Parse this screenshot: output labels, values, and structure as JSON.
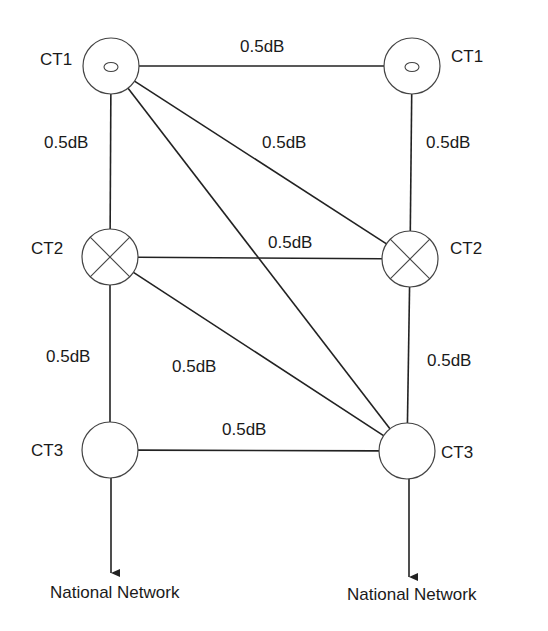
{
  "diagram": {
    "nodes": [
      {
        "id": "l_ct1",
        "label": "CT1",
        "symbol": "small-ellipse",
        "cx": 111,
        "cy": 66,
        "r": 28,
        "label_x": 40,
        "label_y": 65
      },
      {
        "id": "r_ct1",
        "label": "CT1",
        "symbol": "small-ellipse",
        "cx": 412,
        "cy": 66,
        "r": 28,
        "label_x": 451,
        "label_y": 62
      },
      {
        "id": "l_ct2",
        "label": "CT2",
        "symbol": "cross",
        "cx": 110,
        "cy": 257,
        "r": 28,
        "label_x": 31,
        "label_y": 254
      },
      {
        "id": "r_ct2",
        "label": "CT2",
        "symbol": "cross",
        "cx": 410,
        "cy": 259,
        "r": 28,
        "label_x": 450,
        "label_y": 254
      },
      {
        "id": "l_ct3",
        "label": "CT3",
        "symbol": "empty",
        "cx": 110,
        "cy": 450,
        "r": 28,
        "label_x": 31,
        "label_y": 456
      },
      {
        "id": "r_ct3",
        "label": "CT3",
        "symbol": "empty",
        "cx": 407,
        "cy": 451,
        "r": 28,
        "label_x": 441,
        "label_y": 458
      }
    ],
    "edges": [
      {
        "from": "l_ct1",
        "to": "r_ct1",
        "label": "0.5dB",
        "label_x": 240,
        "label_y": 52
      },
      {
        "from": "l_ct1",
        "to": "l_ct2",
        "label": "0.5dB",
        "label_x": 44,
        "label_y": 148
      },
      {
        "from": "r_ct1",
        "to": "r_ct2",
        "label": "0.5dB",
        "label_x": 426,
        "label_y": 148
      },
      {
        "from": "l_ct1",
        "to": "r_ct2",
        "label": "0.5dB",
        "label_x": 262,
        "label_y": 148
      },
      {
        "from": "l_ct1",
        "to": "r_ct3",
        "label": "",
        "label_x": 0,
        "label_y": 0
      },
      {
        "from": "l_ct2",
        "to": "r_ct2",
        "label": "0.5dB",
        "label_x": 268,
        "label_y": 248
      },
      {
        "from": "l_ct2",
        "to": "l_ct3",
        "label": "0.5dB",
        "label_x": 46,
        "label_y": 362
      },
      {
        "from": "r_ct2",
        "to": "r_ct3",
        "label": "0.5dB",
        "label_x": 427,
        "label_y": 366
      },
      {
        "from": "l_ct2",
        "to": "r_ct3",
        "label": "0.5dB",
        "label_x": 172,
        "label_y": 372
      },
      {
        "from": "l_ct3",
        "to": "r_ct3",
        "label": "0.5dB",
        "label_x": 222,
        "label_y": 435
      }
    ],
    "outputs": [
      {
        "from": "l_ct3",
        "x": 111,
        "y_end": 574,
        "label": "National Network",
        "label_x": 50,
        "label_y": 598
      },
      {
        "from": "r_ct3",
        "x": 409,
        "y_end": 578,
        "label": "National Network",
        "label_x": 347,
        "label_y": 600
      }
    ]
  }
}
